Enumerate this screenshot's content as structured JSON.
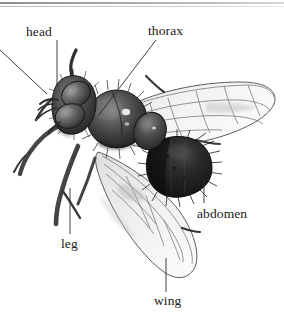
{
  "figure": {
    "kind": "labeled-anatomy-illustration",
    "style": "grayscale halftone engraving",
    "background_color": "#ffffff",
    "ink_color": "#1b1b1b",
    "top_rule": {
      "visible": true,
      "color_dark": "#8e8e8e",
      "color_light": "#d9d9d9"
    }
  },
  "labels": {
    "head": "head",
    "thorax": "thorax",
    "abdomen": "abdomen",
    "leg": "leg",
    "wing": "wing"
  },
  "leader_lines": [
    {
      "name": "head-leader",
      "from": [
        57,
        40
      ],
      "to": [
        57,
        86
      ],
      "style": "straight-vertical"
    },
    {
      "name": "thorax-leader",
      "from": [
        156,
        40
      ],
      "to": [
        98,
        116
      ],
      "style": "straight-diagonal"
    },
    {
      "name": "abdomen-leader",
      "from": [
        204,
        203
      ],
      "to": [
        204,
        178
      ],
      "style": "straight-vertical"
    },
    {
      "name": "leg-leader",
      "from": [
        70,
        234
      ],
      "to": [
        70,
        188
      ],
      "style": "straight-vertical"
    },
    {
      "name": "wing-leader",
      "from": [
        166,
        292
      ],
      "to": [
        166,
        258
      ],
      "style": "straight-vertical"
    },
    {
      "name": "antenna-leader-offscreen",
      "from": [
        0,
        50
      ],
      "to": [
        47,
        94
      ],
      "style": "straight-diagonal-exits-left-edge"
    }
  ],
  "anatomy_parts": [
    {
      "name": "head",
      "description": "rounded head with two large dark compound eyes and short antennae",
      "tone": "dark gray"
    },
    {
      "name": "thorax",
      "description": "large bulbous hairy thorax with specular highlight",
      "tone": "dark gray"
    },
    {
      "name": "abdomen",
      "description": "dark bristly abdomen at rear, hairs fringing outline",
      "tone": "near black"
    },
    {
      "name": "wing",
      "description": "two translucent wings with dark venation, upper wing swept right, lower wing swept down",
      "tone": "pale gray"
    },
    {
      "name": "leg",
      "description": "jointed legs extending down and to the left with bristles",
      "tone": "dark gray"
    }
  ]
}
